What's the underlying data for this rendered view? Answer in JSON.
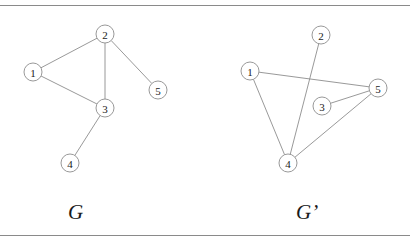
{
  "figure": {
    "background_color": "#ffffff",
    "rule_color": "#8a8a8a",
    "node_stroke_color": "#8d8d8d",
    "edge_color": "#8d8d8d",
    "label_color": "#1a1a1a",
    "node_radius": 9
  },
  "graphs": [
    {
      "id": "G",
      "caption": "G",
      "nodes": [
        {
          "label": "1",
          "x": 33,
          "y": 72
        },
        {
          "label": "2",
          "x": 105,
          "y": 34
        },
        {
          "label": "3",
          "x": 105,
          "y": 108
        },
        {
          "label": "4",
          "x": 70,
          "y": 163
        },
        {
          "label": "5",
          "x": 158,
          "y": 90
        }
      ],
      "edges": [
        {
          "from": "1",
          "to": "2"
        },
        {
          "from": "1",
          "to": "3"
        },
        {
          "from": "2",
          "to": "3"
        },
        {
          "from": "2",
          "to": "5"
        },
        {
          "from": "3",
          "to": "4"
        }
      ]
    },
    {
      "id": "Gp",
      "caption": "G’",
      "nodes": [
        {
          "label": "1",
          "x": 250,
          "y": 71
        },
        {
          "label": "2",
          "x": 321,
          "y": 35
        },
        {
          "label": "3",
          "x": 322,
          "y": 106
        },
        {
          "label": "4",
          "x": 288,
          "y": 163
        },
        {
          "label": "5",
          "x": 378,
          "y": 88
        }
      ],
      "edges": [
        {
          "from": "1",
          "to": "5"
        },
        {
          "from": "1",
          "to": "4"
        },
        {
          "from": "2",
          "to": "4"
        },
        {
          "from": "3",
          "to": "5"
        },
        {
          "from": "4",
          "to": "5"
        }
      ]
    }
  ]
}
